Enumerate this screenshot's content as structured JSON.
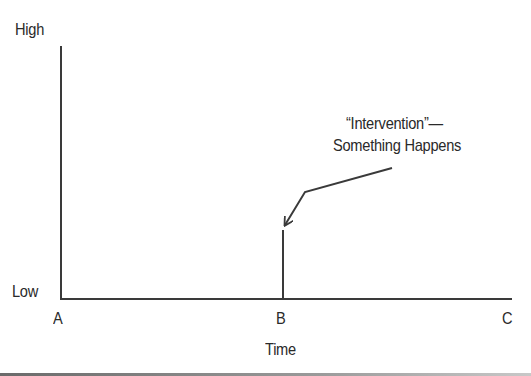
{
  "diagram": {
    "type": "interrupted time series schematic",
    "y_axis": {
      "high_label": "High",
      "low_label": "Low"
    },
    "x_axis": {
      "ticks": [
        "A",
        "B",
        "C"
      ],
      "title": "Time"
    },
    "annotation": {
      "line1": "“Intervention”—",
      "line2": "Something Happens"
    },
    "colors": {
      "line": "#3a3a3a",
      "text": "#2a2a2a",
      "background": "#ffffff"
    }
  }
}
